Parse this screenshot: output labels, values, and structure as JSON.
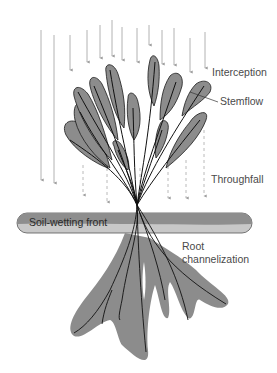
{
  "diagram": {
    "labels": {
      "interception": "Interception",
      "stemflow": "Stemflow",
      "throughfall": "Throughfall",
      "soil_wetting_front": "Soil-wetting front",
      "root_line1": "Root",
      "root_line2": "channelization"
    },
    "colors": {
      "leaf_fill": "#8c8c8c",
      "outline": "#1a1a1a",
      "arrow": "#9a9a9a",
      "soil_bar": "#8e8e8e",
      "soil_bar_light": "#c8c8c8",
      "root_zone": "#8c8c8c",
      "text": "#4a4a4a"
    }
  }
}
